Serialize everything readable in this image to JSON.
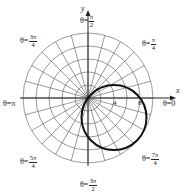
{
  "chart_data": {
    "type": "polar",
    "title": "",
    "curve": {
      "equation": "r = 8cos(θ) - 6sin(θ)",
      "shape": "circle",
      "center_xy": [
        4,
        -3
      ],
      "radius": 5,
      "stroke": "#111111"
    },
    "grid": {
      "rings": [
        2,
        4,
        6,
        8,
        10
      ],
      "radial_step_deg": 15,
      "color": "#555555"
    },
    "axes": {
      "x_label": "x",
      "y_label": "y"
    },
    "tick_labels": [
      "4",
      "8"
    ],
    "angle_labels": [
      {
        "prefix": "θ=",
        "text": "0"
      },
      {
        "prefix": "θ=",
        "num": "π",
        "den": "4"
      },
      {
        "prefix": "θ=",
        "num": "π",
        "den": "2"
      },
      {
        "prefix": "θ=",
        "num": "3π",
        "den": "4"
      },
      {
        "prefix": "θ=",
        "text": "π"
      },
      {
        "prefix": "θ=",
        "num": "5π",
        "den": "4"
      },
      {
        "prefix": "θ=",
        "num": "3π",
        "den": "2"
      },
      {
        "prefix": "θ=",
        "num": "7π",
        "den": "4"
      }
    ]
  }
}
